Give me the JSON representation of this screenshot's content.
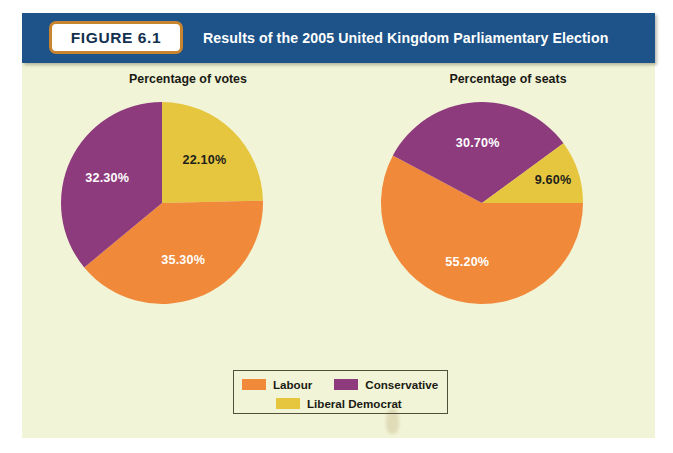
{
  "figure": {
    "badge_label": "FIGURE 6.1",
    "title": "Results of the 2005 United Kingdom Parliamentary Election"
  },
  "colors": {
    "labour": "#f0893a",
    "conservative": "#8d3b7d",
    "liberal_democrat": "#e6c63f",
    "header_blue": "#1d5388",
    "badge_border": "#c8842f",
    "panel_cream": "#f2f4d7",
    "label_dark": "#231f1a",
    "label_light": "#ffffff"
  },
  "legend": {
    "items": [
      {
        "label": "Labour",
        "color": "#f0893a"
      },
      {
        "label": "Conservative",
        "color": "#8d3b7d"
      },
      {
        "label": "Liberal Democrat",
        "color": "#e6c63f"
      }
    ]
  },
  "chart_data": [
    {
      "type": "pie",
      "title": "Percentage of votes",
      "categories": [
        "Liberal Democrat",
        "Labour",
        "Conservative"
      ],
      "values": [
        22.1,
        35.3,
        32.3
      ],
      "labels": [
        "22.10%",
        "35.30%",
        "32.30%"
      ],
      "label_colors": [
        "#231f1a",
        "#ffffff",
        "#ffffff"
      ],
      "slice_colors": [
        "#e6c63f",
        "#f0893a",
        "#8d3b7d"
      ],
      "start_angle_deg": 0,
      "direction": "clockwise",
      "legend_position": "bottom-center"
    },
    {
      "type": "pie",
      "title": "Percentage of seats",
      "categories": [
        "Labour",
        "Conservative",
        "Liberal Democrat"
      ],
      "values": [
        55.2,
        30.7,
        9.6
      ],
      "labels": [
        "55.20%",
        "30.70%",
        "9.60%"
      ],
      "label_colors": [
        "#ffffff",
        "#ffffff",
        "#231f1a"
      ],
      "slice_colors": [
        "#f0893a",
        "#8d3b7d",
        "#e6c63f"
      ],
      "start_angle_deg": 90,
      "direction": "clockwise",
      "legend_position": "bottom-center"
    }
  ]
}
